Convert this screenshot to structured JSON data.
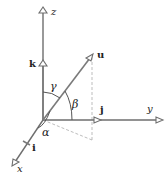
{
  "diagram": {
    "type": "3d-vector-direction-angles",
    "axes": {
      "x": {
        "label": "x"
      },
      "y": {
        "label": "y"
      },
      "z": {
        "label": "z"
      }
    },
    "unit_vectors": {
      "i": {
        "label": "i"
      },
      "j": {
        "label": "j"
      },
      "k": {
        "label": "k"
      }
    },
    "vector": {
      "label": "u"
    },
    "angles": {
      "alpha": {
        "label": "α",
        "between": [
          "x",
          "u"
        ]
      },
      "beta": {
        "label": "β",
        "between": [
          "y",
          "u"
        ]
      },
      "gamma": {
        "label": "γ",
        "between": [
          "z",
          "u"
        ]
      }
    },
    "colors": {
      "lines": "#6e6e6e",
      "dashed": "#b5b5b5",
      "text": "#222222",
      "background": "#ffffff"
    }
  }
}
